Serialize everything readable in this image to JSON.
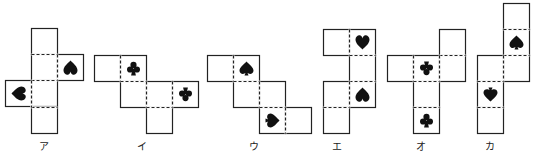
{
  "diagram": {
    "type": "cube-nets",
    "cell_size": 26,
    "line_color": "#222222",
    "symbol_color": "#111111",
    "nets": [
      {
        "label": "ア",
        "label_x": 44,
        "cells": [
          {
            "x": 31,
            "y": 28
          },
          {
            "x": 31,
            "y": 54
          },
          {
            "x": 31,
            "y": 80
          },
          {
            "x": 31,
            "y": 107
          },
          {
            "x": 57,
            "y": 54,
            "symbol": "spade-blunt",
            "rotate": 0
          },
          {
            "x": 5,
            "y": 80,
            "symbol": "spade-blunt",
            "rotate": -90
          }
        ],
        "dashed": [
          {
            "x1": 31,
            "y1": 54,
            "x2": 57,
            "y2": 54
          },
          {
            "x1": 31,
            "y1": 80,
            "x2": 57,
            "y2": 80
          },
          {
            "x1": 31,
            "y1": 107,
            "x2": 57,
            "y2": 107
          },
          {
            "x1": 57,
            "y1": 54,
            "x2": 57,
            "y2": 80
          },
          {
            "x1": 31,
            "y1": 80,
            "x2": 31,
            "y2": 107
          }
        ]
      },
      {
        "label": "イ",
        "label_x": 142,
        "cells": [
          {
            "x": 94,
            "y": 55
          },
          {
            "x": 120,
            "y": 55,
            "symbol": "club",
            "rotate": 0
          },
          {
            "x": 120,
            "y": 81
          },
          {
            "x": 146,
            "y": 81
          },
          {
            "x": 172,
            "y": 81,
            "symbol": "club",
            "rotate": 180
          },
          {
            "x": 146,
            "y": 107
          }
        ],
        "dashed": [
          {
            "x1": 120,
            "y1": 55,
            "x2": 120,
            "y2": 81
          },
          {
            "x1": 120,
            "y1": 81,
            "x2": 146,
            "y2": 81
          },
          {
            "x1": 146,
            "y1": 81,
            "x2": 146,
            "y2": 107
          },
          {
            "x1": 172,
            "y1": 81,
            "x2": 172,
            "y2": 107
          },
          {
            "x1": 146,
            "y1": 107,
            "x2": 172,
            "y2": 107
          }
        ]
      },
      {
        "label": "ウ",
        "label_x": 254,
        "cells": [
          {
            "x": 207,
            "y": 55
          },
          {
            "x": 233,
            "y": 55,
            "symbol": "spade",
            "rotate": 0
          },
          {
            "x": 233,
            "y": 81
          },
          {
            "x": 259,
            "y": 81
          },
          {
            "x": 259,
            "y": 107,
            "symbol": "spade",
            "rotate": 90
          },
          {
            "x": 285,
            "y": 107
          }
        ],
        "dashed": [
          {
            "x1": 233,
            "y1": 55,
            "x2": 233,
            "y2": 81
          },
          {
            "x1": 233,
            "y1": 81,
            "x2": 259,
            "y2": 81
          },
          {
            "x1": 259,
            "y1": 81,
            "x2": 259,
            "y2": 107
          },
          {
            "x1": 259,
            "y1": 107,
            "x2": 285,
            "y2": 107
          },
          {
            "x1": 285,
            "y1": 107,
            "x2": 285,
            "y2": 133
          }
        ]
      },
      {
        "label": "エ",
        "label_x": 337,
        "cells": [
          {
            "x": 323,
            "y": 29
          },
          {
            "x": 349,
            "y": 29,
            "symbol": "heart",
            "rotate": 0
          },
          {
            "x": 349,
            "y": 55
          },
          {
            "x": 349,
            "y": 81,
            "symbol": "spade-blunt",
            "rotate": 0
          },
          {
            "x": 323,
            "y": 81
          },
          {
            "x": 323,
            "y": 107
          }
        ],
        "dashed": [
          {
            "x1": 349,
            "y1": 29,
            "x2": 349,
            "y2": 55
          },
          {
            "x1": 349,
            "y1": 55,
            "x2": 375,
            "y2": 55
          },
          {
            "x1": 349,
            "y1": 81,
            "x2": 375,
            "y2": 81
          },
          {
            "x1": 349,
            "y1": 81,
            "x2": 349,
            "y2": 107
          },
          {
            "x1": 323,
            "y1": 107,
            "x2": 349,
            "y2": 107
          }
        ]
      },
      {
        "label": "オ",
        "label_x": 421,
        "cells": [
          {
            "x": 439,
            "y": 29
          },
          {
            "x": 387,
            "y": 55
          },
          {
            "x": 413,
            "y": 55,
            "symbol": "club",
            "rotate": 180
          },
          {
            "x": 439,
            "y": 55
          },
          {
            "x": 413,
            "y": 81
          },
          {
            "x": 413,
            "y": 107,
            "symbol": "club",
            "rotate": 0
          }
        ],
        "dashed": [
          {
            "x1": 439,
            "y1": 55,
            "x2": 465,
            "y2": 55
          },
          {
            "x1": 413,
            "y1": 55,
            "x2": 413,
            "y2": 81
          },
          {
            "x1": 439,
            "y1": 55,
            "x2": 439,
            "y2": 81
          },
          {
            "x1": 413,
            "y1": 81,
            "x2": 439,
            "y2": 81
          },
          {
            "x1": 413,
            "y1": 107,
            "x2": 439,
            "y2": 107
          }
        ]
      },
      {
        "label": "カ",
        "label_x": 490,
        "cells": [
          {
            "x": 503,
            "y": 3
          },
          {
            "x": 503,
            "y": 29,
            "symbol": "spade",
            "rotate": 0
          },
          {
            "x": 503,
            "y": 55
          },
          {
            "x": 477,
            "y": 55
          },
          {
            "x": 477,
            "y": 81,
            "symbol": "spade",
            "rotate": 180
          },
          {
            "x": 477,
            "y": 107
          }
        ],
        "dashed": [
          {
            "x1": 503,
            "y1": 29,
            "x2": 529,
            "y2": 29
          },
          {
            "x1": 503,
            "y1": 55,
            "x2": 529,
            "y2": 55
          },
          {
            "x1": 503,
            "y1": 55,
            "x2": 503,
            "y2": 81
          },
          {
            "x1": 477,
            "y1": 81,
            "x2": 503,
            "y2": 81
          },
          {
            "x1": 477,
            "y1": 107,
            "x2": 503,
            "y2": 107
          }
        ]
      }
    ]
  }
}
